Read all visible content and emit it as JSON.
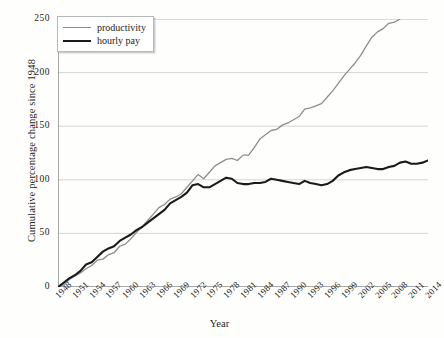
{
  "chart_data": {
    "type": "line",
    "title": "",
    "xlabel": "Year",
    "ylabel": "Cumulative percentage change since 1948",
    "xlim": [
      1948,
      2014
    ],
    "ylim": [
      0,
      250
    ],
    "yticks": [
      0,
      50,
      100,
      150,
      200,
      250
    ],
    "xticks": [
      1948,
      1951,
      1954,
      1957,
      1960,
      1963,
      1966,
      1969,
      1972,
      1975,
      1978,
      1981,
      1984,
      1987,
      1990,
      1993,
      1996,
      1999,
      2002,
      2005,
      2008,
      2011,
      2014
    ],
    "grid": true,
    "legend_position": "top-left",
    "colors": {
      "productivity": "#8d8d8d",
      "hourly_pay": "#1a1a1a",
      "grid": "#c9c9c9",
      "axis": "#555555"
    },
    "series": [
      {
        "name": "productivity",
        "color": "#8d8d8d",
        "x": [
          1948,
          1949,
          1950,
          1951,
          1952,
          1953,
          1954,
          1955,
          1956,
          1957,
          1958,
          1959,
          1960,
          1961,
          1962,
          1963,
          1964,
          1965,
          1966,
          1967,
          1968,
          1969,
          1970,
          1971,
          1972,
          1973,
          1974,
          1975,
          1976,
          1977,
          1978,
          1979,
          1980,
          1981,
          1982,
          1983,
          1984,
          1985,
          1986,
          1987,
          1988,
          1989,
          1990,
          1991,
          1992,
          1993,
          1994,
          1995,
          1996,
          1997,
          1998,
          1999,
          2000,
          2001,
          2002,
          2003,
          2004,
          2005,
          2006,
          2007,
          2008,
          2009,
          2010,
          2011,
          2012,
          2013,
          2014
        ],
        "values": [
          0,
          2,
          7,
          10,
          13,
          17,
          20,
          25,
          26,
          30,
          32,
          38,
          40,
          45,
          51,
          56,
          62,
          68,
          74,
          77,
          82,
          84,
          87,
          93,
          99,
          105,
          101,
          107,
          113,
          116,
          119,
          120,
          118,
          123,
          123,
          130,
          138,
          142,
          146,
          147,
          151,
          153,
          156,
          159,
          166,
          167,
          169,
          171,
          177,
          183,
          190,
          197,
          203,
          209,
          216,
          225,
          233,
          238,
          241,
          246,
          247,
          250,
          258,
          258,
          260,
          261,
          262
        ]
      },
      {
        "name": "hourly pay",
        "color": "#1a1a1a",
        "x": [
          1948,
          1949,
          1950,
          1951,
          1952,
          1953,
          1954,
          1955,
          1956,
          1957,
          1958,
          1959,
          1960,
          1961,
          1962,
          1963,
          1964,
          1965,
          1966,
          1967,
          1968,
          1969,
          1970,
          1971,
          1972,
          1973,
          1974,
          1975,
          1976,
          1977,
          1978,
          1979,
          1980,
          1981,
          1982,
          1983,
          1984,
          1985,
          1986,
          1987,
          1988,
          1989,
          1990,
          1991,
          1992,
          1993,
          1994,
          1995,
          1996,
          1997,
          1998,
          1999,
          2000,
          2001,
          2002,
          2003,
          2004,
          2005,
          2006,
          2007,
          2008,
          2009,
          2010,
          2011,
          2012,
          2013,
          2014
        ],
        "values": [
          0,
          4,
          8,
          11,
          15,
          21,
          23,
          28,
          33,
          36,
          38,
          43,
          46,
          49,
          53,
          56,
          60,
          64,
          68,
          72,
          78,
          81,
          84,
          88,
          95,
          96,
          93,
          93,
          96,
          99,
          102,
          101,
          97,
          96,
          96,
          97,
          97,
          98,
          101,
          100,
          99,
          98,
          97,
          96,
          99,
          97,
          96,
          95,
          96,
          99,
          104,
          107,
          109,
          110,
          111,
          112,
          111,
          110,
          110,
          112,
          113,
          116,
          117,
          115,
          115,
          116,
          118
        ]
      }
    ]
  },
  "legend": {
    "items": [
      {
        "label": "productivity",
        "key": "prod"
      },
      {
        "label": "hourly pay",
        "key": "pay"
      }
    ]
  }
}
